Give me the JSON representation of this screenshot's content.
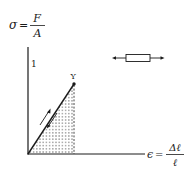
{
  "diagram": {
    "y_axis_label": {
      "lhs": "σ",
      "eq": "=",
      "numerator": "F",
      "denominator": "A"
    },
    "x_axis_label": {
      "lhs": "ϵ",
      "eq": "=",
      "numerator": "Δℓ",
      "denominator": "ℓ"
    },
    "y_axis_tick": "1",
    "point_label": "Y",
    "specimen_icon": "tensile-bar-with-opposing-arrows",
    "colors": {
      "ink": "#1a1a1a",
      "background": "#ffffff"
    }
  }
}
